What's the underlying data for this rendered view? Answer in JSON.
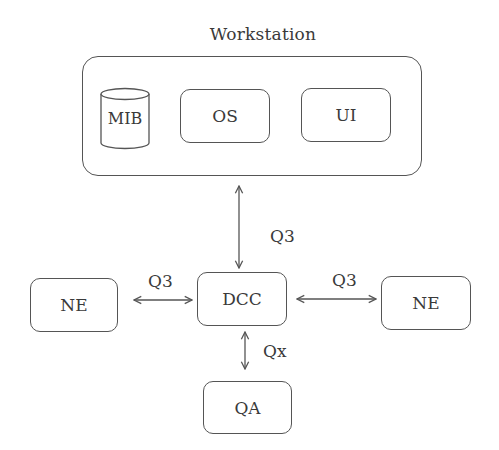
{
  "diagram": {
    "title": "Workstation",
    "workstation": {
      "label": "Workstation",
      "components": [
        {
          "id": "mib",
          "label": "MIB",
          "shape": "cylinder"
        },
        {
          "id": "os",
          "label": "OS",
          "shape": "rounded-rect"
        },
        {
          "id": "ui",
          "label": "UI",
          "shape": "rounded-rect"
        }
      ]
    },
    "nodes": {
      "dcc": {
        "label": "DCC"
      },
      "ne_left": {
        "label": "NE"
      },
      "ne_right": {
        "label": "NE"
      },
      "qa": {
        "label": "QA"
      }
    },
    "edges": [
      {
        "from": "workstation",
        "to": "dcc",
        "label": "Q3",
        "direction": "bidirectional"
      },
      {
        "from": "ne_left",
        "to": "dcc",
        "label": "Q3",
        "direction": "bidirectional"
      },
      {
        "from": "dcc",
        "to": "ne_right",
        "label": "Q3",
        "direction": "bidirectional"
      },
      {
        "from": "dcc",
        "to": "qa",
        "label": "Qx",
        "direction": "bidirectional"
      }
    ],
    "colors": {
      "stroke": "#555555",
      "text": "#3a3a3a",
      "background": "#ffffff"
    }
  }
}
